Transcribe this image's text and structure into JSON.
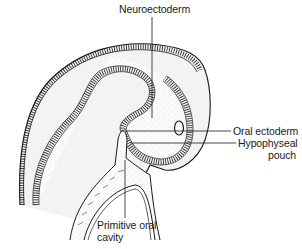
{
  "figure": {
    "type": "anatomical-illustration"
  },
  "labels": {
    "neuroectoderm": "Neuroectoderm",
    "oral_ectoderm": "Oral ectoderm",
    "hypophyseal_pouch_line1": "Hypophyseal",
    "hypophyseal_pouch_line2": "pouch",
    "primitive_oral_cavity_line1": "Primitive oral",
    "primitive_oral_cavity_line2": "cavity"
  },
  "colors": {
    "ink": "#1a1a1a",
    "background": "#ffffff",
    "stipple": "#9a9a9a",
    "mesenchyme": "#f2f2f2"
  }
}
